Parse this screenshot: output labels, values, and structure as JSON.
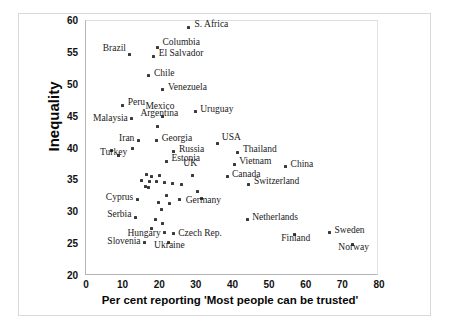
{
  "chart_data": {
    "type": "scatter",
    "title": "",
    "xlabel": "Per cent reporting  'Most people can be trusted'",
    "ylabel": "Inequality",
    "xlim": [
      0,
      80
    ],
    "ylim": [
      20,
      60
    ],
    "xticks": [
      0,
      10,
      20,
      30,
      40,
      50,
      60,
      70,
      80
    ],
    "yticks": [
      20,
      25,
      30,
      35,
      40,
      45,
      50,
      55,
      60
    ],
    "grid": false,
    "legend": null,
    "marker_color": "#3a3a3a",
    "points": [
      {
        "label": "S. Africa",
        "x": 28.0,
        "y": 59.0,
        "lx": 6,
        "ly": -4,
        "anchor": "left"
      },
      {
        "label": "Columbia",
        "x": 19.5,
        "y": 55.8,
        "lx": 5,
        "ly": -7,
        "anchor": "left"
      },
      {
        "label": "Brazil",
        "x": 12.0,
        "y": 54.8,
        "lx": -4,
        "ly": -7,
        "anchor": "right"
      },
      {
        "label": "El Salvador",
        "x": 18.5,
        "y": 54.5,
        "lx": 5,
        "ly": -4,
        "anchor": "left"
      },
      {
        "label": "Chile",
        "x": 17.2,
        "y": 51.4,
        "lx": 5,
        "ly": -4,
        "anchor": "left"
      },
      {
        "label": "Venezuela",
        "x": 21.0,
        "y": 49.2,
        "lx": 5,
        "ly": -4,
        "anchor": "left"
      },
      {
        "label": "Peru",
        "x": 10.0,
        "y": 46.8,
        "lx": 5,
        "ly": -4,
        "anchor": "left"
      },
      {
        "label": "Mexico",
        "x": 21.0,
        "y": 45.0,
        "lx": -3,
        "ly": -12,
        "anchor": "center"
      },
      {
        "label": "Uruguay",
        "x": 29.8,
        "y": 45.8,
        "lx": 5,
        "ly": -4,
        "anchor": "left"
      },
      {
        "label": "Malaysia",
        "x": 12.5,
        "y": 44.7,
        "lx": -4,
        "ly": -2,
        "anchor": "right"
      },
      {
        "label": "Argentina",
        "x": 19.5,
        "y": 43.5,
        "lx": 2,
        "ly": -14,
        "anchor": "center"
      },
      {
        "label": "Iran",
        "x": 14.3,
        "y": 41.2,
        "lx": -4,
        "ly": -4,
        "anchor": "right"
      },
      {
        "label": "Georgia",
        "x": 19.3,
        "y": 41.2,
        "lx": 5,
        "ly": -4,
        "anchor": "left"
      },
      {
        "label": "USA",
        "x": 36.0,
        "y": 40.8,
        "lx": 4,
        "ly": -7,
        "anchor": "left"
      },
      {
        "label": "Turkey",
        "x": 7.0,
        "y": 39.7,
        "lx": 2,
        "ly": 1,
        "anchor": "center"
      },
      {
        "label": "Russia",
        "x": 24.0,
        "y": 39.5,
        "lx": 5,
        "ly": -4,
        "anchor": "left"
      },
      {
        "label": "Thailand",
        "x": 41.5,
        "y": 39.4,
        "lx": 5,
        "ly": -4,
        "anchor": "left"
      },
      {
        "label": "Estonia",
        "x": 22.0,
        "y": 38.0,
        "lx": 5,
        "ly": -4,
        "anchor": "left"
      },
      {
        "label": "Vietnam",
        "x": 40.5,
        "y": 37.5,
        "lx": 5,
        "ly": -4,
        "anchor": "left"
      },
      {
        "label": "China",
        "x": 54.5,
        "y": 37.1,
        "lx": 5,
        "ly": -4,
        "anchor": "left"
      },
      {
        "label": "UK",
        "x": 29.0,
        "y": 35.8,
        "lx": -2,
        "ly": -13,
        "anchor": "center"
      },
      {
        "label": "Canada",
        "x": 38.5,
        "y": 35.6,
        "lx": 5,
        "ly": -4,
        "anchor": "left"
      },
      {
        "label": "Switzerland",
        "x": 44.5,
        "y": 34.4,
        "lx": 5,
        "ly": -4,
        "anchor": "left"
      },
      {
        "label": "Cyprus",
        "x": 14.0,
        "y": 32.0,
        "lx": -4,
        "ly": -4,
        "anchor": "right"
      },
      {
        "label": "Germany",
        "x": 31.5,
        "y": 32.2,
        "lx": 2,
        "ly": 1,
        "anchor": "center"
      },
      {
        "label": "Serbia",
        "x": 13.5,
        "y": 29.2,
        "lx": -4,
        "ly": -4,
        "anchor": "right"
      },
      {
        "label": "Netherlands",
        "x": 44.0,
        "y": 28.8,
        "lx": 5,
        "ly": -4,
        "anchor": "left"
      },
      {
        "label": "Hungary",
        "x": 21.5,
        "y": 26.8,
        "lx": -4,
        "ly": -1,
        "anchor": "right"
      },
      {
        "label": "Czech Rep.",
        "x": 23.8,
        "y": 26.6,
        "lx": 5,
        "ly": -2,
        "anchor": "left"
      },
      {
        "label": "Sweden",
        "x": 66.5,
        "y": 26.8,
        "lx": 5,
        "ly": -4,
        "anchor": "left"
      },
      {
        "label": "Finland",
        "x": 57.0,
        "y": 26.5,
        "lx": 1,
        "ly": 2,
        "anchor": "center"
      },
      {
        "label": "Slovenia",
        "x": 16.0,
        "y": 25.2,
        "lx": -4,
        "ly": -3,
        "anchor": "right"
      },
      {
        "label": "Ukraine",
        "x": 22.5,
        "y": 25.3,
        "lx": 1,
        "ly": 2,
        "anchor": "center"
      },
      {
        "label": "Norway",
        "x": 72.8,
        "y": 25.0,
        "lx": 1,
        "ly": 2,
        "anchor": "center"
      }
    ],
    "unlabeled_points": [
      {
        "x": 16.5,
        "y": 36.0
      },
      {
        "x": 18.0,
        "y": 35.6
      },
      {
        "x": 20.0,
        "y": 35.8
      },
      {
        "x": 15.2,
        "y": 35.0
      },
      {
        "x": 17.3,
        "y": 34.9
      },
      {
        "x": 19.2,
        "y": 34.8
      },
      {
        "x": 21.3,
        "y": 34.6
      },
      {
        "x": 16.2,
        "y": 34.0
      },
      {
        "x": 17.0,
        "y": 33.9
      },
      {
        "x": 23.5,
        "y": 34.5
      },
      {
        "x": 26.0,
        "y": 34.3
      },
      {
        "x": 12.8,
        "y": 40.0
      },
      {
        "x": 8.8,
        "y": 38.9
      },
      {
        "x": 22.0,
        "y": 32.6
      },
      {
        "x": 19.8,
        "y": 31.6
      },
      {
        "x": 20.5,
        "y": 30.4
      },
      {
        "x": 22.8,
        "y": 31.4
      },
      {
        "x": 25.5,
        "y": 32.0
      },
      {
        "x": 19.0,
        "y": 28.9
      },
      {
        "x": 21.0,
        "y": 28.3
      },
      {
        "x": 17.8,
        "y": 27.4
      },
      {
        "x": 30.5,
        "y": 33.2
      }
    ]
  },
  "axis": {
    "y_ticks": [
      "60",
      "55",
      "50",
      "45",
      "40",
      "35",
      "30",
      "25",
      "20"
    ],
    "x_ticks": [
      "0",
      "10",
      "20",
      "30",
      "40",
      "50",
      "60",
      "70",
      "80"
    ],
    "y_title": "Inequality",
    "x_title": "Per cent reporting  'Most people can be trusted'"
  }
}
